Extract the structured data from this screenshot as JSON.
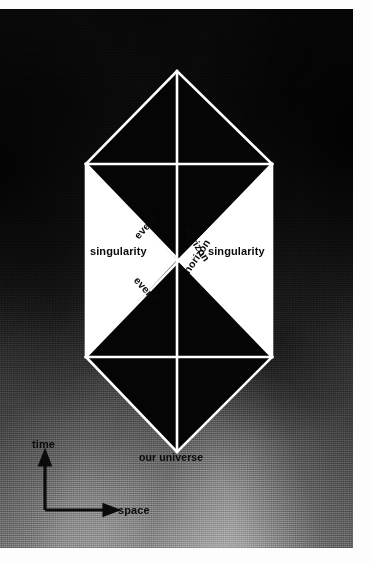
{
  "figure": {
    "kind": "penrose-diagram",
    "background": {
      "style": "grainy photographic vignette",
      "dark_color": "#0a0a0a",
      "light_color": "#bdbdbd"
    },
    "diagram_colors": {
      "line": "#ffffff",
      "fill_dark": "#050505",
      "fill_light": "#ffffff",
      "label": "#0b0b0b"
    }
  },
  "labels": {
    "other_universe": "other universe",
    "our_universe": "our universe",
    "singularity_left": "singularity",
    "singularity_right": "singularity",
    "event_upper_left": "event",
    "horizon_upper_right": "horizon",
    "event_lower_left": "event",
    "horizon_lower_right": "horizon"
  },
  "axes": {
    "time_label": "time",
    "space_label": "space",
    "arrow_color": "#0b0b0b"
  },
  "geometry": {
    "center": {
      "x": 179,
      "y": 251
    },
    "left_vertex": {
      "x": 86,
      "y": 251
    },
    "right_vertex": {
      "x": 272,
      "y": 251
    },
    "top_apex": {
      "x": 177,
      "y": 62
    },
    "bottom_apex": {
      "x": 177,
      "y": 443
    },
    "upper_horizontal_y": 155,
    "lower_horizontal_y": 348,
    "line_width_px": 2.6
  }
}
